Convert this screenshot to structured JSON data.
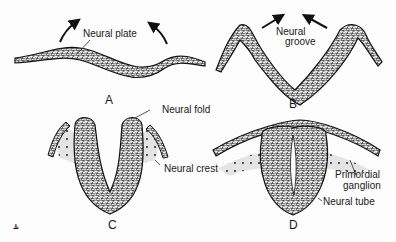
{
  "figure": {
    "panels": [
      {
        "id": "A",
        "label": "A",
        "annotations": [
          "Neural plate"
        ]
      },
      {
        "id": "B",
        "label": "B",
        "annotations": [
          "Neural groove"
        ]
      },
      {
        "id": "C",
        "label": "C",
        "annotations": [
          "Neural fold",
          "Neural crest"
        ]
      },
      {
        "id": "D",
        "label": "D",
        "annotations": [
          "Primordial ganglion",
          "Neural tube"
        ]
      }
    ],
    "labels": {
      "neural_plate": "Neural plate",
      "neural_groove_1": "Neural",
      "neural_groove_2": "groove",
      "neural_fold": "Neural fold",
      "neural_crest": "Neural crest",
      "primordial_1": "Primordial",
      "primordial_2": "ganglion",
      "neural_tube": "Neural tube"
    },
    "corner_mark": "⫨"
  },
  "colors": {
    "ink": "#1a1a1a",
    "tissue_fill": "#8a8a8a",
    "crest_fill": "#d9d9d9"
  }
}
